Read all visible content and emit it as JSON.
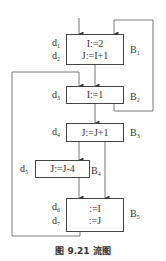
{
  "caption": "图 9.21   流图",
  "blocks": [
    {
      "id": "B1",
      "label": "B",
      "sub": "1",
      "stmts": [
        {
          "d": "d",
          "dsub": "1",
          "code": "I:=2"
        },
        {
          "d": "d",
          "dsub": "2",
          "code": "J:=I+1"
        }
      ]
    },
    {
      "id": "B2",
      "label": "B",
      "sub": "2",
      "stmts": [
        {
          "d": "d",
          "dsub": "3",
          "code": "I:=1"
        }
      ]
    },
    {
      "id": "B3",
      "label": "B",
      "sub": "3",
      "stmts": [
        {
          "d": "d",
          "dsub": "4",
          "code": "J:=J+1"
        }
      ]
    },
    {
      "id": "B4",
      "label": "B",
      "sub": "4",
      "stmts": [
        {
          "d": "d",
          "dsub": "5",
          "code": "J:=J-4"
        }
      ]
    },
    {
      "id": "B5",
      "label": "B",
      "sub": "5",
      "stmts": [
        {
          "d": "d",
          "dsub": "6",
          "code": ":=I"
        },
        {
          "d": "d",
          "dsub": "7",
          "code": ":=J"
        }
      ]
    }
  ],
  "edges": [
    {
      "from": "entry",
      "to": "B1"
    },
    {
      "from": "B1",
      "to": "B2"
    },
    {
      "from": "B2",
      "to": "B3"
    },
    {
      "from": "B2",
      "to": "B1"
    },
    {
      "from": "B3",
      "to": "B4"
    },
    {
      "from": "B3",
      "to": "B5"
    },
    {
      "from": "B4",
      "to": "B5"
    },
    {
      "from": "B5",
      "to": "B2"
    }
  ]
}
